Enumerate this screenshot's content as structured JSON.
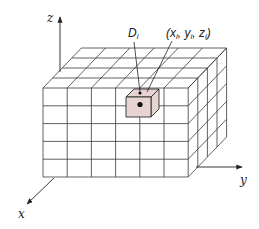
{
  "diagram": {
    "axes": {
      "z": {
        "label": "z"
      },
      "y": {
        "label": "y"
      },
      "x": {
        "label": "x"
      }
    },
    "grid": {
      "columns": 6,
      "rows": 5,
      "depth": 4
    },
    "highlighted_cell": {
      "label_main": "D",
      "label_sub": "i",
      "coord_open": "(x",
      "coord_sub1": "i",
      "coord_sep1": ", y",
      "coord_sub2": "i",
      "coord_sep2": ", z",
      "coord_sub3": "i",
      "coord_close": ")",
      "fill_color": "#e6d3d2"
    },
    "colors": {
      "line": "#3a3a3a",
      "background": "#ffffff"
    }
  }
}
